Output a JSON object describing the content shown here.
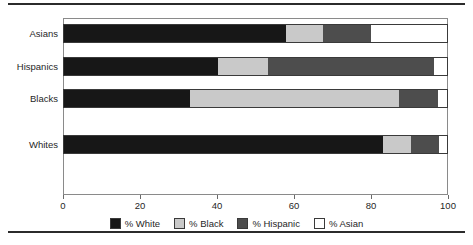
{
  "chart_data": {
    "type": "bar",
    "orientation": "horizontal",
    "stacked": true,
    "stack_mode": "percent",
    "title": "",
    "subtitle": "",
    "xlabel": "",
    "ylabel": "",
    "categories": [
      "Asians",
      "Hispanics",
      "Blacks",
      "Whites"
    ],
    "xlim": [
      0,
      100
    ],
    "xticks": [
      0,
      20,
      40,
      60,
      80,
      100
    ],
    "xticklabels": [
      "0",
      "20",
      "40",
      "60",
      "80",
      "100"
    ],
    "grid": false,
    "legend_position": "bottom",
    "series": [
      {
        "name": "% White",
        "color": "#171717",
        "values": [
          58.0,
          40.2,
          32.9,
          83.0
        ]
      },
      {
        "name": "% Black",
        "color": "#c9c9c9",
        "values": [
          9.6,
          13.1,
          54.3,
          7.3
        ]
      },
      {
        "name": "% Hispanic",
        "color": "#4d4d4d",
        "values": [
          12.3,
          43.0,
          10.2,
          7.4
        ]
      },
      {
        "name": "% Asian",
        "color": "#ffffff",
        "values": [
          20.1,
          3.7,
          2.6,
          2.3
        ]
      }
    ],
    "row_gap_after": [
      1,
      1,
      2,
      0
    ],
    "colors": {
      "white_segment": "#171717",
      "black_segment": "#c9c9c9",
      "hispanic_segment": "#4d4d4d",
      "asian_segment": "#ffffff",
      "frame": "#8a8a8a",
      "rule": "#2b2b2b",
      "text": "#1f1f1f"
    }
  }
}
